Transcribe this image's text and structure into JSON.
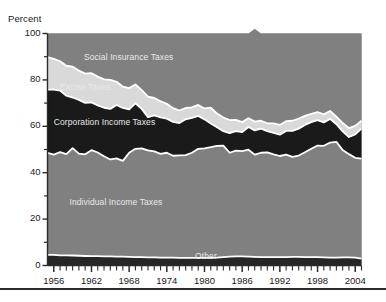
{
  "figure": {
    "axis_title": "Percent",
    "bottom_rule": true
  },
  "chart_data": {
    "type": "area",
    "stacked": true,
    "title": "",
    "subtitle": "",
    "xlabel": "",
    "ylabel": "Percent",
    "xlim": [
      1955,
      2005
    ],
    "ylim": [
      0,
      100
    ],
    "grid": false,
    "legend_position": "inline-annotations",
    "y_ticks_major": [
      0,
      20,
      40,
      60,
      80,
      100
    ],
    "y_ticks_minor": [
      10,
      30,
      50,
      70,
      90
    ],
    "x_tick_labels": [
      "1956",
      "1962",
      "1968",
      "1974",
      "1980",
      "1986",
      "1992",
      "1998",
      "2004"
    ],
    "x_tick_label_years": [
      1956,
      1962,
      1968,
      1974,
      1980,
      1986,
      1992,
      1998,
      2004
    ],
    "x_minor_tick_step": 1,
    "colors": {
      "social_insurance": "#808080",
      "excise": "#d9d9d9",
      "corporation": "#1a1a1a",
      "individual": "#808080",
      "other": "#262626",
      "separator": "#ffffff",
      "axis": "#2b2b2b",
      "text": "#1a1a1a",
      "inline_label_text": "#e8e8e8"
    },
    "annotations": [
      {
        "text": "Social Insurance Taxes",
        "x": 1960.8,
        "y": 89.5
      },
      {
        "text": "Excise Taxes",
        "x": 1957.0,
        "y": 76.5
      },
      {
        "text": "Corporation Income Taxes",
        "x": 1956.0,
        "y": 61.5
      },
      {
        "text": "Individual Income Taxes",
        "x": 1958.5,
        "y": 27.0
      },
      {
        "text": "Other",
        "x": 1978.5,
        "y": 3.5
      }
    ],
    "x": [
      1955,
      1956,
      1957,
      1958,
      1959,
      1960,
      1961,
      1962,
      1963,
      1964,
      1965,
      1966,
      1967,
      1968,
      1969,
      1970,
      1971,
      1972,
      1973,
      1974,
      1975,
      1976,
      1977,
      1978,
      1979,
      1980,
      1981,
      1982,
      1983,
      1984,
      1985,
      1986,
      1987,
      1988,
      1989,
      1990,
      1991,
      1992,
      1993,
      1994,
      1995,
      1996,
      1997,
      1998,
      1999,
      2000,
      2001,
      2002,
      2003,
      2004,
      2005
    ],
    "series": [
      {
        "name": "Other",
        "values": [
          4.6,
          4.6,
          4.4,
          4.4,
          4.3,
          4.2,
          4.1,
          4.0,
          4.0,
          3.9,
          3.9,
          3.8,
          3.8,
          3.7,
          3.6,
          3.6,
          3.5,
          3.5,
          3.4,
          3.4,
          3.4,
          3.3,
          3.3,
          3.3,
          3.3,
          3.3,
          3.3,
          3.4,
          3.6,
          3.8,
          3.9,
          3.9,
          3.8,
          3.7,
          3.6,
          3.6,
          3.6,
          3.6,
          3.6,
          3.7,
          3.7,
          3.6,
          3.6,
          3.6,
          3.5,
          3.4,
          3.4,
          3.5,
          3.5,
          3.4,
          3.0
        ]
      },
      {
        "name": "Individual Income Taxes",
        "values": [
          43.9,
          43.2,
          44.5,
          43.6,
          46.3,
          44.0,
          43.8,
          45.7,
          44.7,
          43.2,
          41.8,
          42.4,
          41.3,
          44.9,
          46.7,
          46.9,
          46.1,
          45.7,
          44.7,
          45.2,
          43.9,
          44.2,
          44.3,
          45.3,
          47.0,
          47.2,
          47.7,
          48.2,
          48.1,
          44.8,
          45.6,
          45.4,
          46.1,
          44.1,
          45.0,
          45.2,
          44.3,
          43.6,
          44.2,
          43.1,
          43.7,
          45.2,
          46.7,
          48.1,
          48.1,
          49.6,
          49.9,
          46.3,
          44.5,
          43.0,
          43.1
        ]
      },
      {
        "name": "Corporation Income Taxes",
        "values": [
          27.3,
          28.0,
          26.5,
          25.2,
          21.8,
          23.2,
          22.2,
          20.6,
          20.3,
          20.9,
          21.8,
          23.0,
          22.8,
          18.7,
          19.6,
          17.0,
          14.3,
          15.5,
          15.7,
          14.7,
          14.6,
          13.9,
          15.4,
          15.0,
          14.2,
          12.5,
          10.2,
          8.0,
          6.2,
          8.5,
          8.4,
          8.2,
          9.8,
          10.4,
          10.4,
          9.1,
          9.3,
          9.2,
          10.2,
          11.2,
          11.6,
          11.8,
          11.5,
          11.0,
          10.1,
          10.2,
          7.6,
          8.0,
          7.4,
          10.1,
          12.9
        ]
      },
      {
        "name": "Excise Taxes",
        "values": [
          14.0,
          13.3,
          12.6,
          12.9,
          13.3,
          12.6,
          12.6,
          12.6,
          12.4,
          12.2,
          12.5,
          10.0,
          9.2,
          9.2,
          8.1,
          8.1,
          8.9,
          7.5,
          7.0,
          6.4,
          5.9,
          5.4,
          4.9,
          4.6,
          4.7,
          4.7,
          6.8,
          5.9,
          5.9,
          5.6,
          4.9,
          4.3,
          3.8,
          3.8,
          3.4,
          3.4,
          4.1,
          4.2,
          4.2,
          4.4,
          4.3,
          3.9,
          3.6,
          3.4,
          3.5,
          3.4,
          3.3,
          3.6,
          3.8,
          3.7,
          3.4
        ]
      },
      {
        "name": "Social Insurance Taxes",
        "values": [
          10.2,
          10.9,
          12.0,
          13.9,
          14.3,
          16.0,
          17.3,
          17.1,
          18.6,
          19.8,
          20.0,
          20.8,
          22.9,
          23.5,
          22.0,
          24.4,
          27.2,
          27.8,
          29.2,
          30.3,
          32.2,
          33.2,
          32.1,
          31.8,
          30.8,
          32.3,
          32.0,
          34.5,
          36.2,
          37.3,
          37.2,
          38.2,
          36.5,
          40.0,
          37.6,
          38.7,
          38.7,
          39.4,
          37.8,
          37.6,
          36.7,
          35.5,
          34.6,
          33.9,
          34.8,
          33.4,
          35.8,
          38.6,
          40.8,
          39.8,
          37.6
        ]
      }
    ]
  }
}
